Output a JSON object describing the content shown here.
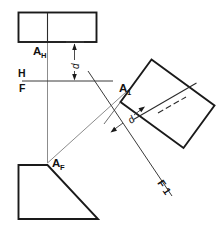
{
  "drawing": {
    "title": "Orthographic projection with auxiliary view",
    "type": "engineering-drawing",
    "background_color": "#ffffff",
    "line_color": "#1a1a1a",
    "projection_line_color": "#8c8c8c"
  },
  "labels": {
    "point_top": "A",
    "point_top_sub": "H",
    "point_front": "A",
    "point_front_sub": "F",
    "point_aux": "A",
    "point_aux_sub": "1",
    "fold_h": "H",
    "fold_f": "F",
    "fold_aux": "F 1",
    "dim_top": "d",
    "dim_aux": "d"
  },
  "views": {
    "top_view": {
      "name": "top-view-rectangle",
      "description": "Top view rectangle with vertical divider"
    },
    "front_view": {
      "name": "front-view-trapezoid",
      "description": "Front view right trapezoid"
    },
    "auxiliary_view": {
      "name": "auxiliary-view-rectangle",
      "description": "Tilted auxiliary view rectangle with divider and hidden line"
    }
  },
  "annotations": {
    "fold_line_hf": "H/F fold line between top and front views",
    "fold_line_f1": "F/1 fold line between front and auxiliary views",
    "dimension_top": "distance d from top view to H/F fold line",
    "dimension_aux": "distance d from F/1 fold line to auxiliary view"
  }
}
